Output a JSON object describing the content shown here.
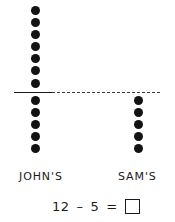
{
  "worksheet": {
    "groups": [
      {
        "name": "johns",
        "label": "JOHN'S",
        "total": 12,
        "dots_above_line": 7,
        "dots_below_line": 5
      },
      {
        "name": "sams",
        "label": "SAM'S",
        "total": 5,
        "dots_above_line": 0,
        "dots_below_line": 5
      }
    ],
    "equation": {
      "minuend": "12",
      "operator": "–",
      "subtrahend": "5",
      "equals": "=",
      "answer": ""
    },
    "colors": {
      "ink": "#1b1b1b",
      "dot": "#131313",
      "background": "#ffffff",
      "divider": "#3a3a3a"
    }
  }
}
